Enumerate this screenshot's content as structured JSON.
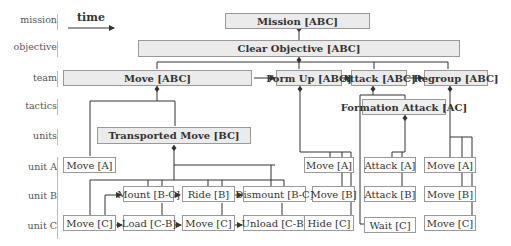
{
  "time_label": "time",
  "row_labels": {
    "mission": "mission",
    "objective": "objective",
    "team": "team",
    "tactics": "tactics",
    "units": "units",
    "unit_a": "unit A",
    "unit_b": "unit B",
    "unit_c": "unit C"
  },
  "nodes": {
    "mission": "Mission [ABC]",
    "clear_objective": "Clear Objective [ABC]",
    "move_abc": "Move [ABC]",
    "form_up": "Form Up [ABC]",
    "attack_abc": "Attack [ABC]",
    "regroup": "Regroup [ABC]",
    "formation_attack": "Formation Attack [AC]",
    "transported_move": "Transported Move [BC]",
    "move_a1": "Move [A]",
    "mount": "Mount [B-C]",
    "ride": "Ride [B]",
    "dismount": "Dismount [B-C]",
    "move_c1": "Move [C]",
    "load": "Load [C-B]",
    "move_c2": "Move [C]",
    "unload": "Unload [C-B]",
    "move_a2": "Move [A]",
    "move_b1": "Move [B]",
    "hide": "Hide [C]",
    "attack_a": "Attack [A]",
    "attack_b": "Attack [B]",
    "wait": "Wait [C]",
    "move_a3": "Move [A]",
    "move_b2": "Move [B]",
    "move_c3": "Move [C]"
  },
  "colors": {
    "box_fill_header": "#ebebeb",
    "box_border": "#999999",
    "line": "#333333"
  }
}
